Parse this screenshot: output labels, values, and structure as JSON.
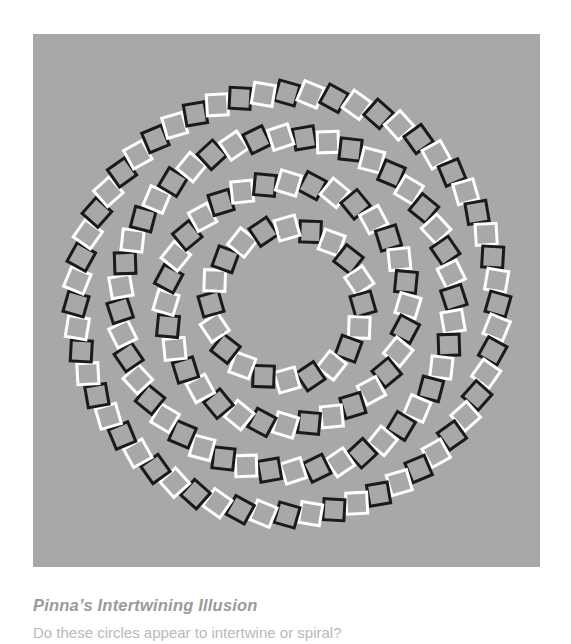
{
  "page": {
    "background_color": "#ffffff",
    "width": 571,
    "height": 631
  },
  "figure": {
    "panel_background_color": "#a8a8a8",
    "panel_x": 33,
    "panel_y": 34,
    "panel_width": 507,
    "panel_height": 533,
    "square_black_color": "#1a1a1a",
    "square_white_color": "#ffffff",
    "square_stroke_width": 3,
    "square_size": 21
  },
  "caption": {
    "title": "Pinna’s Intertwining Illusion",
    "title_color": "#9a9a9a",
    "body": "Do these circles appear to intertwine or spiral?",
    "body_color": "#b9b9b9"
  },
  "chart_data": {
    "type": "scatter",
    "title": "Pinna’s Intertwining Illusion",
    "xlabel": "",
    "ylabel": "",
    "center": {
      "x": 254,
      "y": 270
    },
    "grid": false,
    "legend": false,
    "series": [
      {
        "name": "ring-1-outer",
        "radius": 211,
        "count": 56,
        "start_angle_deg": -90,
        "square_tilt_deg": 16,
        "colors": [
          "#1a1a1a",
          "#ffffff"
        ]
      },
      {
        "name": "ring-2",
        "radius": 167,
        "count": 44,
        "start_angle_deg": -84,
        "square_tilt_deg": -16,
        "colors": [
          "#1a1a1a",
          "#ffffff"
        ]
      },
      {
        "name": "ring-3",
        "radius": 121,
        "count": 32,
        "start_angle_deg": -78,
        "square_tilt_deg": 16,
        "colors": [
          "#1a1a1a",
          "#ffffff"
        ]
      },
      {
        "name": "ring-4-inner",
        "radius": 76,
        "count": 20,
        "start_angle_deg": -72,
        "square_tilt_deg": -16,
        "colors": [
          "#1a1a1a",
          "#ffffff"
        ]
      }
    ]
  }
}
